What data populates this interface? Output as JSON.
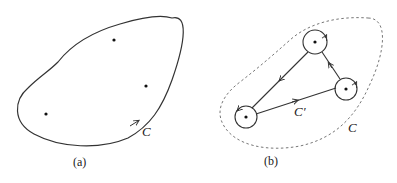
{
  "figure": {
    "panel_a": {
      "caption": "(a)",
      "contour_label": "C",
      "points": [
        {
          "x": 114,
          "y": 40
        },
        {
          "x": 146,
          "y": 86
        },
        {
          "x": 46,
          "y": 114
        }
      ]
    },
    "panel_b": {
      "caption": "(b)",
      "inner_contour_label": "C′",
      "outer_contour_label": "C",
      "points": [
        {
          "x": 315,
          "y": 42
        },
        {
          "x": 346,
          "y": 89
        },
        {
          "x": 246,
          "y": 117
        }
      ]
    },
    "colors": {
      "stroke": "#333333",
      "dashed": "#777777",
      "background": "#ffffff"
    }
  }
}
